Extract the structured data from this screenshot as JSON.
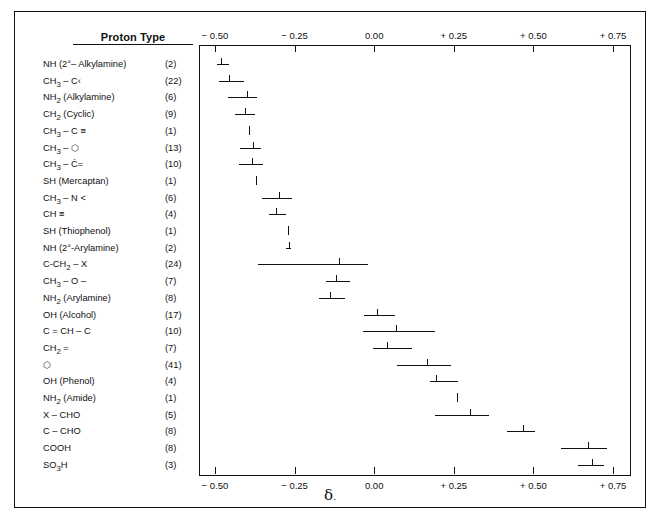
{
  "header": {
    "column_title": "Proton Type",
    "axis_symbol": "δ",
    "axis_symbol_suffix": "."
  },
  "axis": {
    "ticks": [
      "− 0.50",
      "− 0.25",
      "0.00",
      "+ 0.25",
      "+ 0.50",
      "+ 0.75"
    ],
    "tick_values": [
      -0.5,
      -0.25,
      0.0,
      0.25,
      0.5,
      0.75
    ]
  },
  "chart_data": {
    "type": "bar",
    "title": "Proton Type",
    "xlabel": "δ",
    "ylabel": "Proton Type",
    "xlim": [
      -0.55,
      0.8
    ],
    "grid": false,
    "legend": false,
    "note": "Horizontal range bars with a center tick showing substituent chemical-shift contribution (delta) per proton type; parenthetical number is the sample count.",
    "categories": [
      "NH (2°– Alkylamine)",
      "CH3 – C",
      "NH2 (Alkylamine)",
      "CH2 (Cyclic)",
      "CH3 – C ≡",
      "CH3 – C6H5",
      "CH3 – C=",
      "SH (Mercaptan)",
      "CH3 – N <",
      "CH ≡",
      "SH (Thiophenol)",
      "NH (2°-Arylamine)",
      "C-CH2 – X",
      "CH3 – O –",
      "NH2 (Arylamine)",
      "OH (Alcohol)",
      "C = CH – C",
      "CH2 =",
      "C6H6",
      "OH (Phenol)",
      "NH2 (Amide)",
      "X – CHO",
      "C – CHO",
      "COOH",
      "SO3H"
    ],
    "rows": [
      {
        "label_html": "NH (2°– Alkylamine)",
        "count": "(2)",
        "low": -0.495,
        "high": -0.455,
        "center": -0.48
      },
      {
        "label_html": "CH<sub>3</sub> – C‹",
        "count": "(22)",
        "low": -0.487,
        "high": -0.41,
        "center": -0.455
      },
      {
        "label_html": "NH<sub>2</sub> (Alkylamine)",
        "count": "(6)",
        "low": -0.46,
        "high": -0.368,
        "center": -0.4
      },
      {
        "label_html": "CH<sub>2</sub> (Cyclic)",
        "count": "(9)",
        "low": -0.437,
        "high": -0.375,
        "center": -0.405
      },
      {
        "label_html": "CH<sub>3</sub> – C ≡",
        "count": "(1)",
        "low": -0.392,
        "high": -0.392,
        "center": -0.392
      },
      {
        "label_html": "CH<sub>3</sub> – ⬡",
        "count": "(13)",
        "low": -0.42,
        "high": -0.355,
        "center": -0.382
      },
      {
        "label_html": "CH<sub>3</sub> – Ċ=",
        "count": "(10)",
        "low": -0.423,
        "high": -0.348,
        "center": -0.385
      },
      {
        "label_html": "SH (Mercaptan)",
        "count": "(1)",
        "low": -0.372,
        "high": -0.372,
        "center": -0.372
      },
      {
        "label_html": "CH<sub>3</sub> – N <",
        "count": "(6)",
        "low": -0.352,
        "high": -0.258,
        "center": -0.3
      },
      {
        "label_html": "CH ≡",
        "count": "(4)",
        "low": -0.33,
        "high": -0.278,
        "center": -0.308
      },
      {
        "label_html": "SH (Thiophenol)",
        "count": "(1)",
        "low": -0.272,
        "high": -0.272,
        "center": -0.272
      },
      {
        "label_html": "NH (2°-Arylamine)",
        "count": "(2)",
        "low": -0.278,
        "high": -0.262,
        "center": -0.268
      },
      {
        "label_html": "C-CH<sub>2</sub> – X",
        "count": "(24)",
        "low": -0.365,
        "high": -0.018,
        "center": -0.11
      },
      {
        "label_html": "CH<sub>3</sub> – O –",
        "count": "(7)",
        "low": -0.15,
        "high": -0.075,
        "center": -0.12
      },
      {
        "label_html": "NH<sub>2</sub> (Arylamine)",
        "count": "(8)",
        "low": -0.172,
        "high": -0.092,
        "center": -0.14
      },
      {
        "label_html": "OH (Alcohol)",
        "count": "(17)",
        "low": -0.032,
        "high": 0.065,
        "center": 0.01
      },
      {
        "label_html": "C = CH – C",
        "count": "(10)",
        "low": -0.035,
        "high": 0.19,
        "center": 0.07
      },
      {
        "label_html": "CH<sub>2</sub> =",
        "count": "(7)",
        "low": -0.005,
        "high": 0.118,
        "center": 0.04
      },
      {
        "label_html": "⬡",
        "count": "(41)",
        "low": 0.072,
        "high": 0.24,
        "center": 0.165
      },
      {
        "label_html": "OH (Phenol)",
        "count": "(4)",
        "low": 0.175,
        "high": 0.262,
        "center": 0.195
      },
      {
        "label_html": "NH<sub>2</sub> (Amide)",
        "count": "(1)",
        "low": 0.26,
        "high": 0.26,
        "center": 0.26
      },
      {
        "label_html": "X – CHO",
        "count": "(5)",
        "low": 0.192,
        "high": 0.36,
        "center": 0.3
      },
      {
        "label_html": "C – CHO",
        "count": "(8)",
        "low": 0.418,
        "high": 0.505,
        "center": 0.468
      },
      {
        "label_html": "COOH",
        "count": "(8)",
        "low": 0.585,
        "high": 0.73,
        "center": 0.672
      },
      {
        "label_html": "SO<sub>3</sub>H",
        "count": "(3)",
        "low": 0.64,
        "high": 0.72,
        "center": 0.685
      }
    ]
  }
}
